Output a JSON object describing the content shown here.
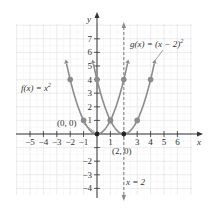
{
  "chart_data": {
    "type": "line",
    "title": "",
    "xlabel": "x",
    "ylabel": "y",
    "xlim": [
      -6,
      7
    ],
    "ylim": [
      -4.5,
      8
    ],
    "grid": true,
    "x_ticks": [
      -5,
      -4,
      -3,
      -2,
      -1,
      1,
      3,
      4,
      5,
      6
    ],
    "x_tick_labels": [
      "−5",
      "−4",
      "−3",
      "−2",
      "−1",
      "1",
      "3",
      "4",
      "5",
      "6"
    ],
    "y_ticks": [
      7,
      6,
      5,
      4,
      3,
      2,
      1,
      -2,
      -3,
      -4
    ],
    "y_tick_labels": [
      "7",
      "6",
      "5",
      "4",
      "3",
      "2",
      "1",
      "−2",
      "−3",
      "−4"
    ],
    "series": [
      {
        "name": "f(x) = x^2",
        "label": "f(x) = x",
        "label_exp": "2",
        "points": [
          [
            -2,
            4
          ],
          [
            -1,
            1
          ],
          [
            0,
            0
          ],
          [
            1,
            1
          ],
          [
            2,
            4
          ]
        ]
      },
      {
        "name": "g(x) = (x - 2)^2",
        "label": "g(x) = (x − 2)",
        "label_exp": "2",
        "points": [
          [
            0,
            4
          ],
          [
            1,
            1
          ],
          [
            2,
            0
          ],
          [
            3,
            1
          ],
          [
            4,
            4
          ]
        ]
      }
    ],
    "annotations": [
      {
        "text": "(0, 0)",
        "x": 0,
        "y": 0
      },
      {
        "text": "(2, 0)",
        "x": 2,
        "y": 0
      },
      {
        "text": "x = 2",
        "type": "vertical-dashed-line",
        "x": 2
      }
    ],
    "colors": {
      "curve": "#8c8c8c",
      "axis": "#333333",
      "grid": "#e4e4e4"
    }
  }
}
